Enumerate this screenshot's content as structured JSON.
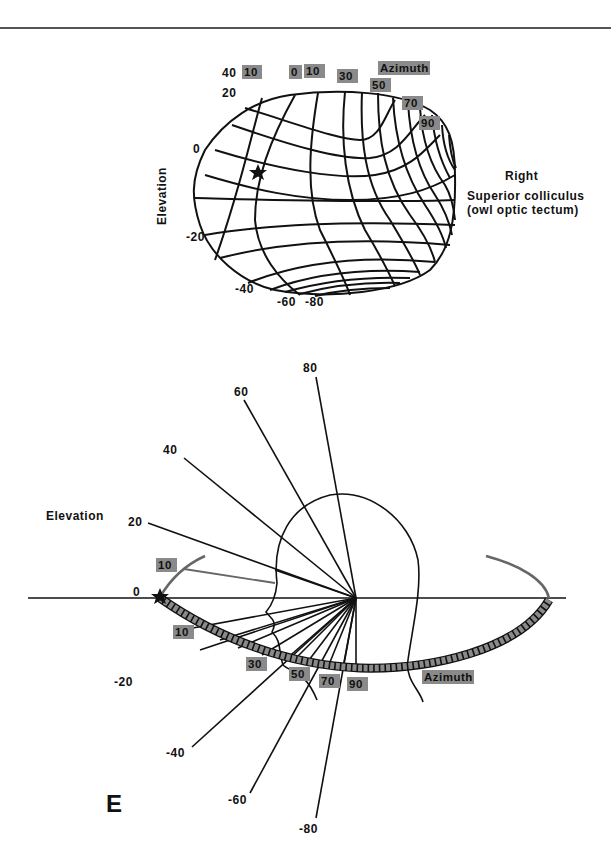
{
  "figure": {
    "panel_letter": "E",
    "colors": {
      "ink": "#111111",
      "badge": "#8a8a8a",
      "background": "#ffffff"
    }
  },
  "top_map": {
    "side_label": "Right",
    "structure_label_line1": "Superior colliculus",
    "structure_label_line2": "(owl optic tectum)",
    "elevation_axis_label": "Elevation",
    "azimuth_axis_label": "Azimuth",
    "elevation_ticks": [
      "40",
      "20",
      "0",
      "-20",
      "-40",
      "-60",
      "-80"
    ],
    "azimuth_ticks": [
      "10",
      "0",
      "10",
      "30",
      "50",
      "70",
      "90"
    ],
    "marker": "star"
  },
  "bottom_map": {
    "elevation_axis_label": "Elevation",
    "azimuth_axis_label": "Azimuth",
    "elevation_ticks": [
      "80",
      "60",
      "40",
      "20",
      "0",
      "-20",
      "-40",
      "-60",
      "-80"
    ],
    "azimuth_ticks": [
      "10",
      "10",
      "30",
      "50",
      "70",
      "90"
    ],
    "marker": "star"
  }
}
